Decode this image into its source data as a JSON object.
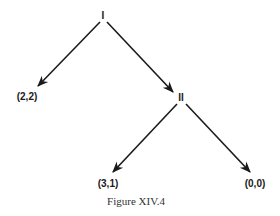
{
  "diagram": {
    "type": "game-tree",
    "nodes": [
      {
        "id": "I",
        "label": "I",
        "kind": "decision"
      },
      {
        "id": "II",
        "label": "II",
        "kind": "decision"
      },
      {
        "id": "t1",
        "label": "(2,2)",
        "kind": "terminal"
      },
      {
        "id": "t2",
        "label": "(3,1)",
        "kind": "terminal"
      },
      {
        "id": "t3",
        "label": "(0,0)",
        "kind": "terminal"
      }
    ],
    "edges": [
      {
        "from": "I",
        "to": "t1"
      },
      {
        "from": "I",
        "to": "II"
      },
      {
        "from": "II",
        "to": "t2"
      },
      {
        "from": "II",
        "to": "t3"
      }
    ],
    "line_color": "#1a1a1a"
  },
  "caption": "Figure XIV.4"
}
